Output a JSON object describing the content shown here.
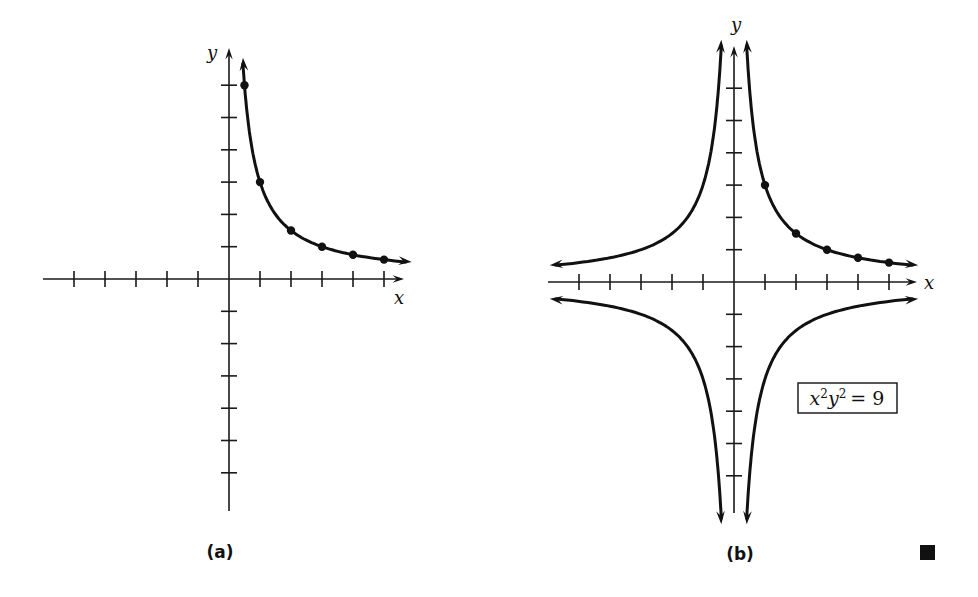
{
  "chart_data": [
    {
      "panel": "(a)",
      "type": "line",
      "title": "",
      "xlabel": "x",
      "ylabel": "y",
      "equation": "xy = 3 (first quadrant)",
      "x_ticks": [
        -5,
        -4,
        -3,
        -2,
        -1,
        1,
        2,
        3,
        4,
        5
      ],
      "y_ticks": [
        -6,
        -5,
        -4,
        -3,
        -2,
        -1,
        1,
        2,
        3,
        4,
        5,
        6
      ],
      "xlim": [
        -6,
        6
      ],
      "ylim": [
        -7.5,
        7.5
      ],
      "grid": false,
      "series": [
        {
          "name": "branch-Q1",
          "points": [
            [
              0.5,
              6
            ],
            [
              1,
              3
            ],
            [
              2,
              1.5
            ],
            [
              3,
              1
            ],
            [
              4,
              0.75
            ],
            [
              5,
              0.6
            ]
          ],
          "marked_points": true
        }
      ]
    },
    {
      "panel": "(b)",
      "type": "line",
      "title": "",
      "xlabel": "x",
      "ylabel": "y",
      "equation": "x^2 y^2 = 9",
      "x_ticks": [
        -5,
        -4,
        -3,
        -2,
        -1,
        1,
        2,
        3,
        4,
        5
      ],
      "y_ticks": [
        -6,
        -5,
        -4,
        -3,
        -2,
        -1,
        1,
        2,
        3,
        4,
        5,
        6
      ],
      "xlim": [
        -6,
        6
      ],
      "ylim": [
        -7.5,
        7.5
      ],
      "grid": false,
      "series": [
        {
          "name": "branch-Q1",
          "points": [
            [
              1,
              3
            ],
            [
              2,
              1.5
            ],
            [
              3,
              1
            ],
            [
              4,
              0.75
            ],
            [
              5,
              0.6
            ]
          ],
          "marked_points": true
        },
        {
          "name": "branch-Q2",
          "points": [],
          "marked_points": false
        },
        {
          "name": "branch-Q3",
          "points": [],
          "marked_points": false
        },
        {
          "name": "branch-Q4",
          "points": [],
          "marked_points": false
        }
      ]
    }
  ],
  "panels": {
    "a": {
      "label": "(a)",
      "x_axis_label": "x",
      "y_axis_label": "y"
    },
    "b": {
      "label": "(b)",
      "x_axis_label": "x",
      "y_axis_label": "y",
      "formula": {
        "x": "x",
        "y": "y",
        "exp": "2",
        "rhs": "= 9"
      }
    }
  },
  "layout": {
    "a": {
      "ox": 229,
      "oy": 279,
      "ux": 31,
      "uy": 32.3,
      "x_axis": [
        43,
        404
      ],
      "y_axis": [
        48,
        511
      ],
      "curve_xmin": 0.45,
      "curve_xmax": 5.7
    },
    "b": {
      "ox": 734,
      "oy": 282,
      "ux": 31,
      "uy": 32.3,
      "x_axis": [
        548,
        917
      ],
      "y_axis": [
        46,
        513
      ],
      "curve_xmin": 0.41,
      "curve_xmax": 5.75
    }
  },
  "end_mark": "■"
}
